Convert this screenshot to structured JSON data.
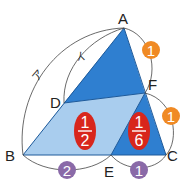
{
  "diagram": {
    "type": "geometry-triangle-area-ratio",
    "vertices": {
      "A": {
        "label": "A",
        "x": 124,
        "y": 28
      },
      "B": {
        "label": "B",
        "x": 23,
        "y": 155
      },
      "C": {
        "label": "C",
        "x": 166,
        "y": 155
      },
      "D": {
        "label": "D",
        "x": 64,
        "y": 103
      },
      "E": {
        "label": "E",
        "x": 111,
        "y": 155
      },
      "F": {
        "label": "F",
        "x": 145,
        "y": 93
      }
    },
    "arc_labels": {
      "outer": "ア",
      "inner": "イ"
    },
    "ratio_badges": {
      "AF": "1",
      "FC": "1",
      "BE": "2",
      "EC": "1"
    },
    "area_fractions": {
      "DBEF": {
        "numerator": "1",
        "denominator": "2"
      },
      "FEC": {
        "numerator": "1",
        "denominator": "6"
      }
    },
    "colors": {
      "dark_blue": "#2f7fd0",
      "light_blue": "#a9cdee",
      "orange": "#f08a24",
      "purple": "#8a6aa8",
      "red": "#d8261c",
      "stroke": "#333333"
    }
  }
}
